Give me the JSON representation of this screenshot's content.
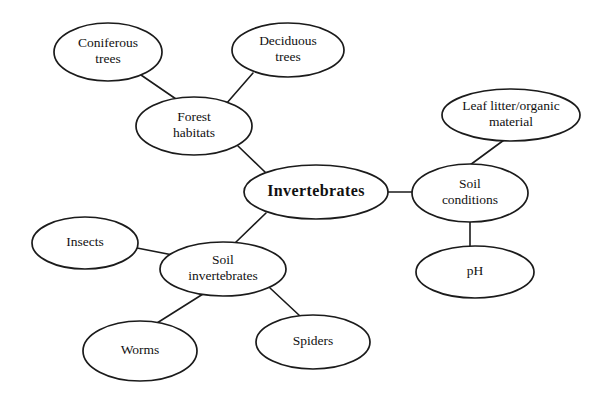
{
  "diagram": {
    "type": "concept-map",
    "background_color": "#ffffff",
    "line_color": "#1b1b1b",
    "text_color": "#111111",
    "canvas": {
      "width": 615,
      "height": 407
    }
  },
  "nodes": [
    {
      "id": "coniferous-trees",
      "lines": [
        "Coniferous",
        "trees"
      ],
      "cx": 108,
      "cy": 52,
      "rx": 54,
      "ry": 29,
      "emphasis": "normal"
    },
    {
      "id": "deciduous-trees",
      "lines": [
        "Deciduous",
        "trees"
      ],
      "cx": 288,
      "cy": 50,
      "rx": 56,
      "ry": 27,
      "emphasis": "normal"
    },
    {
      "id": "forest-habitats",
      "lines": [
        "Forest",
        "habitats"
      ],
      "cx": 194,
      "cy": 126,
      "rx": 58,
      "ry": 29,
      "emphasis": "normal"
    },
    {
      "id": "leaf-litter-organic-material",
      "lines": [
        "Leaf litter/organic",
        "material"
      ],
      "cx": 511,
      "cy": 115,
      "rx": 69,
      "ry": 26,
      "emphasis": "normal"
    },
    {
      "id": "invertebrates",
      "lines": [
        "Invertebrates"
      ],
      "cx": 316,
      "cy": 192,
      "rx": 72,
      "ry": 27,
      "emphasis": "central"
    },
    {
      "id": "soil-conditions",
      "lines": [
        "Soil",
        "conditions"
      ],
      "cx": 470,
      "cy": 193,
      "rx": 58,
      "ry": 29,
      "emphasis": "normal"
    },
    {
      "id": "insects",
      "lines": [
        "Insects"
      ],
      "cx": 85,
      "cy": 243,
      "rx": 53,
      "ry": 26,
      "emphasis": "normal"
    },
    {
      "id": "soil-invertebrates",
      "lines": [
        "Soil",
        "invertebrates"
      ],
      "cx": 223,
      "cy": 269,
      "rx": 63,
      "ry": 27,
      "emphasis": "normal"
    },
    {
      "id": "ph",
      "lines": [
        "pH"
      ],
      "cx": 475,
      "cy": 272,
      "rx": 59,
      "ry": 26,
      "emphasis": "normal"
    },
    {
      "id": "worms",
      "lines": [
        "Worms"
      ],
      "cx": 140,
      "cy": 351,
      "rx": 57,
      "ry": 30,
      "emphasis": "normal"
    },
    {
      "id": "spiders",
      "lines": [
        "Spiders"
      ],
      "cx": 313,
      "cy": 342,
      "rx": 57,
      "ry": 27,
      "emphasis": "normal"
    }
  ],
  "edges": [
    {
      "id": "coniferous-to-forest",
      "from": "coniferous-trees",
      "to": "forest-habitats",
      "x1": 141,
      "y1": 75,
      "x2": 176,
      "y2": 99
    },
    {
      "id": "deciduous-to-forest",
      "from": "deciduous-trees",
      "to": "forest-habitats",
      "x1": 253,
      "y1": 73,
      "x2": 226,
      "y2": 104
    },
    {
      "id": "forest-to-invertebrates",
      "from": "forest-habitats",
      "to": "invertebrates",
      "x1": 238,
      "y1": 146,
      "x2": 265,
      "y2": 172
    },
    {
      "id": "invertebrates-to-soil-conditions",
      "from": "invertebrates",
      "to": "soil-conditions",
      "x1": 388,
      "y1": 192,
      "x2": 413,
      "y2": 192
    },
    {
      "id": "invertebrates-to-soil-invertebrates",
      "from": "invertebrates",
      "to": "soil-invertebrates",
      "x1": 266,
      "y1": 213,
      "x2": 235,
      "y2": 243
    },
    {
      "id": "leaf-litter-to-soil-conditions",
      "from": "leaf-litter-organic-material",
      "to": "soil-conditions",
      "x1": 504,
      "y1": 140,
      "x2": 470,
      "y2": 165
    },
    {
      "id": "soil-conditions-to-ph",
      "from": "soil-conditions",
      "to": "ph",
      "x1": 470,
      "y1": 222,
      "x2": 470,
      "y2": 246
    },
    {
      "id": "insects-to-soil-invertebrates",
      "from": "insects",
      "to": "soil-invertebrates",
      "x1": 137,
      "y1": 248,
      "x2": 178,
      "y2": 256
    },
    {
      "id": "soil-invertebrates-to-worms",
      "from": "soil-invertebrates",
      "to": "worms",
      "x1": 203,
      "y1": 294,
      "x2": 157,
      "y2": 323
    },
    {
      "id": "soil-invertebrates-to-spiders",
      "from": "soil-invertebrates",
      "to": "spiders",
      "x1": 270,
      "y1": 288,
      "x2": 300,
      "y2": 316
    }
  ]
}
